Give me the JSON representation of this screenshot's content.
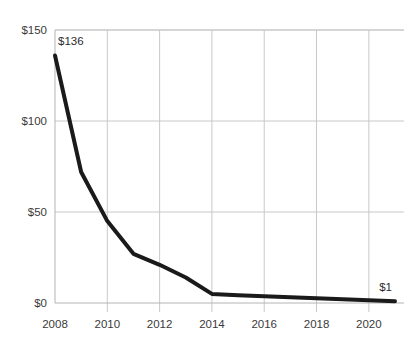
{
  "chart_data": {
    "type": "line",
    "title": "",
    "subtitle": "",
    "xlabel": "",
    "ylabel": "",
    "x": [
      2008,
      2009,
      2010,
      2011,
      2012,
      2013,
      2014,
      2015,
      2016,
      2017,
      2018,
      2019,
      2020,
      2021
    ],
    "values": [
      136,
      72,
      45,
      27,
      21,
      14,
      5,
      4.3,
      3.7,
      3.1,
      2.6,
      2.1,
      1.5,
      1
    ],
    "series": [
      {
        "name": "Cost",
        "values": [
          136,
          72,
          45,
          27,
          21,
          14,
          5,
          4.3,
          3.7,
          3.1,
          2.6,
          2.1,
          1.5,
          1
        ]
      }
    ],
    "xlim": [
      2008,
      2021
    ],
    "ylim": [
      0,
      150
    ],
    "ytick_values": [
      0,
      50,
      100,
      150
    ],
    "ytick_labels": [
      "$0",
      "$50",
      "$100",
      "$150"
    ],
    "xtick_values": [
      2008,
      2010,
      2012,
      2014,
      2016,
      2018,
      2020
    ],
    "xtick_labels": [
      "2008",
      "2010",
      "2012",
      "2014",
      "2016",
      "2018",
      "2020"
    ],
    "gridlines": {
      "horizontal": true,
      "vertical": true,
      "color": "#c8c8c8"
    },
    "legend": {
      "visible": false,
      "position": "none",
      "entries": []
    },
    "annotations": [
      {
        "label": "$136",
        "x": 2008,
        "y": 136,
        "placement": "above-right"
      },
      {
        "label": "$1",
        "x": 2021,
        "y": 1,
        "placement": "above-left"
      }
    ],
    "line_color": "#1a1a1a",
    "line_width": 4,
    "axis_color": "#b4b4b4",
    "background": "#ffffff"
  }
}
